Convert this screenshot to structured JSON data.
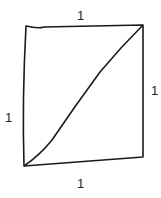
{
  "diagram": {
    "type": "square-with-diagonal",
    "stroke_color": "#1a1a1a",
    "background": "#ffffff",
    "labels": {
      "top": "1",
      "left": "1",
      "right": "1",
      "bottom": "1"
    }
  }
}
